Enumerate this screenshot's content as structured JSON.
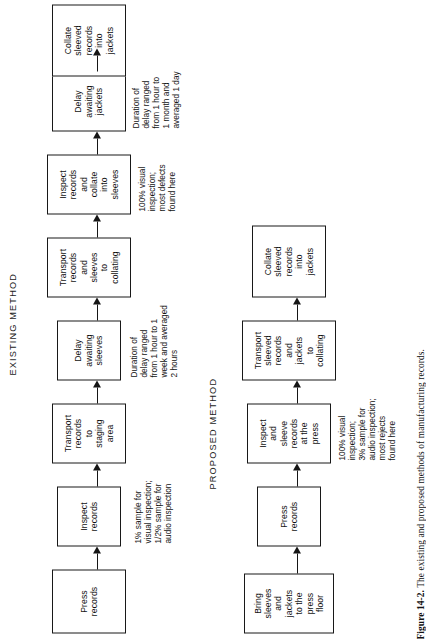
{
  "figure": {
    "caption_number": "Figure 14-2.",
    "caption_text": "The existing and proposed methods of manufacturing records."
  },
  "existing": {
    "label": "EXISTING METHOD",
    "nodes": [
      {
        "name": "press-records",
        "lines": [
          "Press",
          "records"
        ]
      },
      {
        "name": "inspect-records",
        "lines": [
          "Inspect",
          "records"
        ]
      },
      {
        "name": "transport-to-staging",
        "lines": [
          "Transport",
          "records",
          "to",
          "staging",
          "area"
        ]
      },
      {
        "name": "delay-awaiting-sleeves",
        "lines": [
          "Delay",
          "awaiting",
          "sleeves"
        ]
      },
      {
        "name": "transport-to-collating",
        "lines": [
          "Transport",
          "records",
          "and",
          "sleeves",
          "to",
          "collating"
        ]
      },
      {
        "name": "inspect-and-collate",
        "lines": [
          "Inspect",
          "records",
          "and",
          "collate",
          "into",
          "sleeves"
        ]
      },
      {
        "name": "delay-awaiting-jackets",
        "lines": [
          "Delay",
          "awaiting",
          "jackets"
        ]
      },
      {
        "name": "collate-into-jackets",
        "lines": [
          "Collate",
          "sleeved",
          "records",
          "into",
          "jackets"
        ]
      }
    ],
    "notes": [
      {
        "name": "note-sampling",
        "lines": [
          "1% sample for",
          "visual inspection;",
          "1/2% sample for",
          "audio inspection"
        ]
      },
      {
        "name": "note-delay-sleeves",
        "lines": [
          "Duration of",
          "delay ranged",
          "from 1 hour to 1",
          "week and averaged",
          "2 hours"
        ]
      },
      {
        "name": "note-inspection",
        "lines": [
          "100% visual",
          "inspection;",
          "most defects",
          "found here"
        ]
      },
      {
        "name": "note-delay-jackets",
        "lines": [
          "Duration of",
          "delay ranged",
          "from 1 hour to",
          "1 month and",
          "averaged 1 day"
        ]
      }
    ]
  },
  "proposed": {
    "label": "PROPOSED METHOD",
    "nodes": [
      {
        "name": "bring-sleeves-jackets",
        "lines": [
          "Bring",
          "sleeves",
          "and",
          "jackets",
          "to the",
          "press",
          "floor"
        ]
      },
      {
        "name": "press-records",
        "lines": [
          "Press",
          "records"
        ]
      },
      {
        "name": "inspect-and-sleeve",
        "lines": [
          "Inspect",
          "and",
          "sleeve",
          "records",
          "at the",
          "press"
        ]
      },
      {
        "name": "transport-to-collating",
        "lines": [
          "Transport",
          "sleeved",
          "records",
          "and",
          "jackets",
          "to",
          "collating"
        ]
      },
      {
        "name": "collate-into-jackets",
        "lines": [
          "Collate",
          "sleeved",
          "records",
          "into",
          "jackets"
        ]
      }
    ],
    "notes": [
      {
        "name": "note-inspection",
        "lines": [
          "100% visual",
          "inspection;",
          "3% sample for",
          "audio inspection;",
          "most rejects",
          "found here"
        ]
      }
    ]
  }
}
